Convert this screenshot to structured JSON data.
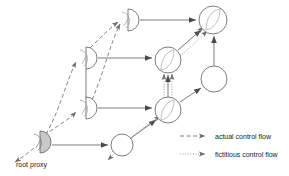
{
  "figure": {
    "type": "node-link-diagram",
    "background": "#ffffff",
    "stroke_color": "#6e6e6e",
    "text_color": "#1a1a1a",
    "fill_highlight": "#c9c9c9"
  },
  "labels": {
    "root_proxy": "root proxy"
  },
  "legend": {
    "items": [
      {
        "label": "actual control flow",
        "style": "dashed"
      },
      {
        "label": "fictitious control flow",
        "style": "dotted"
      }
    ]
  },
  "nodes": [
    {
      "id": "p-top",
      "shape": "half-disc",
      "cx": 128,
      "cy": 20,
      "r": 11,
      "filled": false,
      "inner_arc": true
    },
    {
      "id": "p-upper",
      "shape": "half-disc",
      "cx": 86,
      "cy": 58,
      "r": 11,
      "filled": false,
      "inner_arc": true
    },
    {
      "id": "p-lower",
      "shape": "half-disc",
      "cx": 86,
      "cy": 108,
      "r": 11,
      "filled": false,
      "inner_arc": true
    },
    {
      "id": "p-root",
      "shape": "half-disc",
      "cx": 40,
      "cy": 142,
      "r": 11,
      "filled": true,
      "inner_arc": true
    },
    {
      "id": "c-topright",
      "shape": "circle",
      "cx": 213,
      "cy": 20,
      "r": 14,
      "filled": false,
      "inner_arc": true
    },
    {
      "id": "c-mid",
      "shape": "circle",
      "cx": 168,
      "cy": 60,
      "r": 13,
      "filled": false,
      "inner_arc": true
    },
    {
      "id": "c-right",
      "shape": "circle",
      "cx": 214,
      "cy": 79,
      "r": 13,
      "filled": false,
      "inner_arc": false
    },
    {
      "id": "c-low",
      "shape": "circle",
      "cx": 168,
      "cy": 110,
      "r": 13,
      "filled": false,
      "inner_arc": true
    },
    {
      "id": "c-bottom",
      "shape": "circle",
      "cx": 122,
      "cy": 145,
      "r": 11,
      "filled": false,
      "inner_arc": false
    }
  ],
  "edges": [
    {
      "from": "p-top",
      "to": "c-topright",
      "style": "solid"
    },
    {
      "from": "p-upper",
      "to": "c-mid",
      "style": "solid"
    },
    {
      "from": "p-lower",
      "to": "c-low",
      "style": "solid"
    },
    {
      "from": "p-root",
      "to": "c-bottom",
      "style": "solid"
    },
    {
      "from": "p-top",
      "to": "p-upper",
      "style": "solid"
    },
    {
      "from": "p-upper",
      "to": "p-lower",
      "style": "solid"
    },
    {
      "from": "c-right",
      "to": "c-topright",
      "style": "solid"
    },
    {
      "from": "c-mid",
      "to": "c-topright",
      "style": "solid"
    },
    {
      "from": "c-low",
      "to": "c-mid",
      "style": "solid"
    },
    {
      "from": "c-low",
      "to": "c-right",
      "style": "solid"
    },
    {
      "from": "c-bottom",
      "to": "c-low",
      "style": "solid"
    }
  ],
  "flows": {
    "actual": [
      {
        "from": "p-root",
        "to": "p-lower"
      },
      {
        "from": "p-root",
        "to": "p-upper"
      },
      {
        "from": "p-upper",
        "to": "p-top"
      },
      {
        "from": "p-root",
        "to": "outside"
      }
    ],
    "fictitious": [
      {
        "from": "c-bottom",
        "to": "c-low"
      },
      {
        "from": "c-low",
        "to": "c-mid"
      },
      {
        "from": "c-mid",
        "to": "c-topright"
      },
      {
        "from": "c-bottom",
        "to": "outside"
      }
    ]
  }
}
